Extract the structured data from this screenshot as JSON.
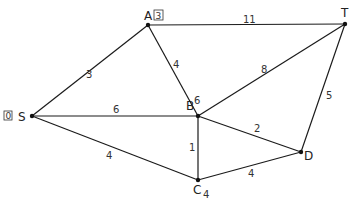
{
  "diagram": {
    "type": "weighted-graph",
    "nodes": [
      {
        "id": "S",
        "label": "S",
        "x": 32,
        "y": 116,
        "annotation": "0",
        "annotation_style": "boxed"
      },
      {
        "id": "A",
        "label": "A",
        "x": 148,
        "y": 25,
        "annotation": "3",
        "annotation_style": "boxed"
      },
      {
        "id": "T",
        "label": "T",
        "x": 345,
        "y": 24
      },
      {
        "id": "B",
        "label": "B",
        "x": 198,
        "y": 116,
        "annotation": "6",
        "annotation_style": "superscript"
      },
      {
        "id": "D",
        "label": "D",
        "x": 301,
        "y": 152
      },
      {
        "id": "C",
        "label": "C",
        "x": 198,
        "y": 180,
        "annotation": "4",
        "annotation_style": "subscript"
      }
    ],
    "edges": [
      {
        "from": "S",
        "to": "A",
        "weight": "3"
      },
      {
        "from": "A",
        "to": "T",
        "weight": "11"
      },
      {
        "from": "A",
        "to": "B",
        "weight": "4"
      },
      {
        "from": "S",
        "to": "B",
        "weight": "6"
      },
      {
        "from": "B",
        "to": "T",
        "weight": "8"
      },
      {
        "from": "S",
        "to": "C",
        "weight": "4"
      },
      {
        "from": "B",
        "to": "C",
        "weight": "1"
      },
      {
        "from": "B",
        "to": "D",
        "weight": "2"
      },
      {
        "from": "C",
        "to": "D",
        "weight": "4"
      },
      {
        "from": "D",
        "to": "T",
        "weight": "5"
      }
    ]
  }
}
